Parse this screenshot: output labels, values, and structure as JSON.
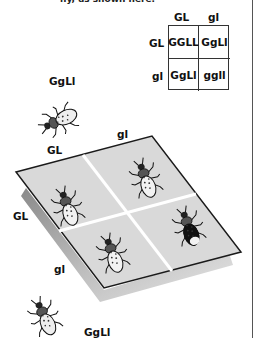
{
  "caption_fragment": "ny, as shown here.",
  "punnett": {
    "col_headers": [
      "GL",
      "gl"
    ],
    "row_headers": [
      "GL",
      "gl"
    ],
    "cells": [
      "GGLL",
      "GgLl",
      "GgLl",
      "ggll"
    ]
  },
  "parents": {
    "top_label": "GgLl",
    "bottom_label": "GgLl"
  },
  "plane": {
    "col_labels": [
      "GL",
      "gl"
    ],
    "row_labels": [
      "GL",
      "gl"
    ],
    "offspring": [
      {
        "genotype": "GGLL",
        "phenotype": "light"
      },
      {
        "genotype": "GgLl",
        "phenotype": "light"
      },
      {
        "genotype": "GgLl",
        "phenotype": "light"
      },
      {
        "genotype": "ggll",
        "phenotype": "dark"
      }
    ]
  },
  "colors": {
    "plane_fill": "#d9d9d9",
    "plane_under": "#a8a8a8",
    "divider": "#ffffff",
    "outline": "#1a1a1a",
    "dark_beetle": "#111111",
    "light_beetle": "#f2f2f2"
  }
}
